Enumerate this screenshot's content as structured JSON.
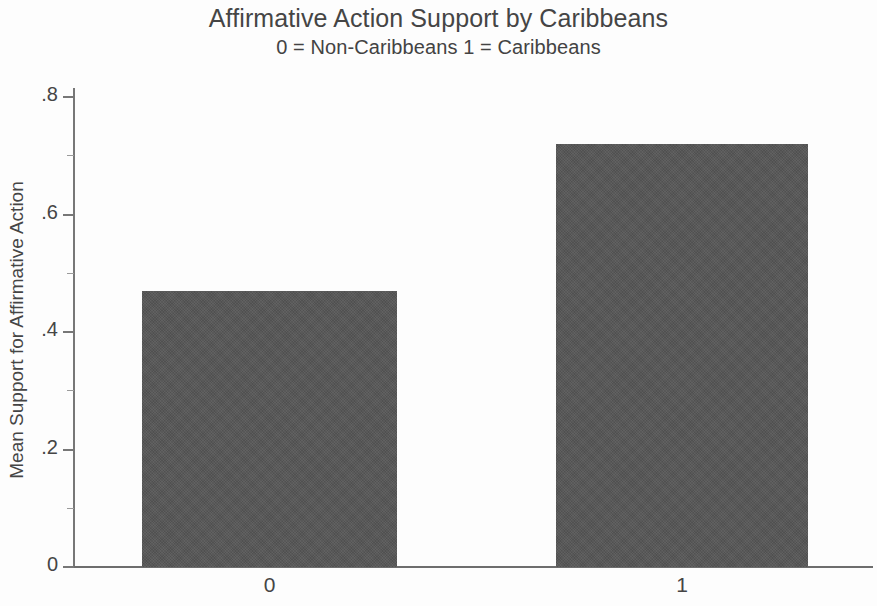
{
  "chart_data": {
    "type": "bar",
    "title": "Affirmative Action Support by Caribbeans",
    "subtitle": "0 = Non-Caribbeans 1 = Caribbeans",
    "xlabel": "",
    "ylabel": "Mean Support for Affirmative Action",
    "categories": [
      "0",
      "1"
    ],
    "values": [
      0.47,
      0.72
    ],
    "ylim": [
      0,
      0.8
    ],
    "yticks": [
      0,
      0.2,
      0.4,
      0.6,
      0.8
    ],
    "ytick_labels": [
      "0",
      ".2",
      ".4",
      ".6",
      ".8"
    ],
    "minor_yticks": [
      0.1,
      0.3,
      0.5,
      0.7
    ],
    "grid": false,
    "legend": null,
    "bar_color": "#565656",
    "background_color": "#fdfdfd",
    "axis_color": "#6d6d6d",
    "text_color": "#454545"
  },
  "axis": {
    "y_title": "Mean Support for Affirmative Action"
  }
}
